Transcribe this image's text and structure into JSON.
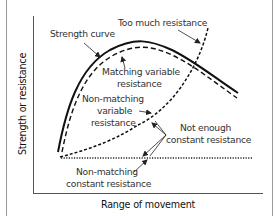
{
  "diagram": {
    "type": "strength-resistance-curves",
    "axes": {
      "x_label": "Range of movement",
      "y_label": "Strength or resistance"
    },
    "curves": [
      {
        "id": "strength",
        "name": "Strength curve",
        "style": "solid-thick",
        "color": "#111111"
      },
      {
        "id": "matching-variable",
        "name": "Matching variable resistance",
        "style": "dashed",
        "color": "#111111"
      },
      {
        "id": "non-matching-variable",
        "name": "Non-matching variable resistance",
        "style": "dotted-dashed",
        "color": "#111111"
      },
      {
        "id": "too-much",
        "name": "Too much resistance",
        "style": "dotted-dashed",
        "color": "#111111"
      },
      {
        "id": "non-matching-constant",
        "name": "Non-matching constant resistance",
        "style": "dotted-horizontal",
        "color": "#111111"
      }
    ],
    "labels": {
      "strength_curve": "Strength curve",
      "too_much": "Too much resistance",
      "matching_1": "Matching variable",
      "matching_2": "resistance",
      "nonmatch_var_1": "Non-matching",
      "nonmatch_var_2": "variable",
      "nonmatch_var_3": "resistance",
      "not_enough_1": "Not enough",
      "not_enough_2": "constant resistance",
      "nonmatch_const_1": "Non-matching",
      "nonmatch_const_2": "constant resistance"
    }
  }
}
